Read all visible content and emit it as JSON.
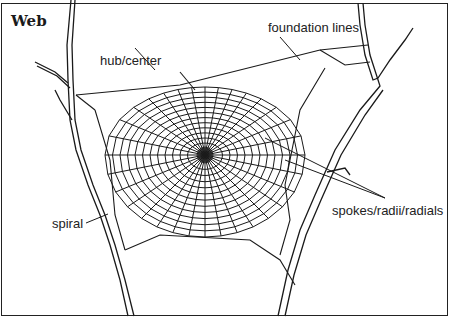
{
  "diagram": {
    "title": "Web",
    "labels": {
      "foundation": "foundation lines",
      "hub": "hub/center",
      "spiral": "spiral",
      "spokes": "spokes/radii/radials"
    },
    "colors": {
      "line": "#1a1a1a",
      "background": "#ffffff"
    },
    "web": {
      "center": [
        205,
        155
      ],
      "spoke_count": 32,
      "spiral_rings": 12
    }
  }
}
